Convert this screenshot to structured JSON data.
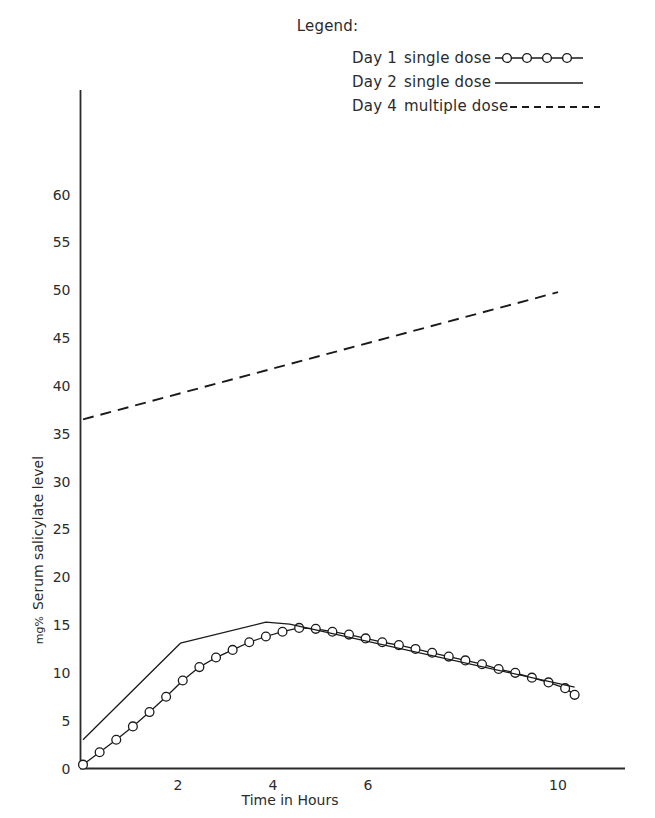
{
  "legend": {
    "heading": "Legend:",
    "entries": [
      {
        "day": "Day 1",
        "description": "single dose",
        "style": "line-with-circle-markers"
      },
      {
        "day": "Day 2",
        "description": "single dose",
        "style": "solid-line"
      },
      {
        "day": "Day 4",
        "description": "multiple dose",
        "style": "dashed-line"
      }
    ]
  },
  "chart_data": {
    "type": "line",
    "title": "",
    "xlabel": "Time in Hours",
    "ylabel": "mg% Serum salicylate level",
    "ylabel_prefix": "mg%",
    "ylabel_main": "Serum salicylate level",
    "xlim": [
      0,
      10.6
    ],
    "ylim": [
      0,
      62
    ],
    "xticks": [
      2,
      4,
      6,
      10
    ],
    "xtick_labels": [
      "2",
      "4",
      "6",
      "10"
    ],
    "yticks": [
      0,
      5,
      10,
      15,
      20,
      25,
      30,
      35,
      40,
      45,
      50,
      55,
      60
    ],
    "ytick_labels": [
      "0",
      "5",
      "10",
      "15",
      "20",
      "25",
      "30",
      "35",
      "40",
      "45",
      "50",
      "55",
      "60"
    ],
    "grid": false,
    "legend_position": "top-right",
    "axis_color": "#2b2b2b",
    "series": [
      {
        "name": "Day 1  single dose",
        "style": "solid-with-open-circle-markers",
        "color": "#1a1a1a",
        "marker": "open-circle",
        "x": [
          0.0,
          0.35,
          0.7,
          1.05,
          1.4,
          1.75,
          2.1,
          2.45,
          2.8,
          3.15,
          3.5,
          3.85,
          4.2,
          4.55,
          4.9,
          5.25,
          5.6,
          5.95,
          6.3,
          6.65,
          7.0,
          7.35,
          7.7,
          8.05,
          8.4,
          8.75,
          9.1,
          9.45,
          9.8,
          10.15,
          10.35
        ],
        "y": [
          0.4,
          1.7,
          3.0,
          4.4,
          5.9,
          7.5,
          9.2,
          10.6,
          11.6,
          12.4,
          13.2,
          13.8,
          14.3,
          14.7,
          14.6,
          14.3,
          14.0,
          13.6,
          13.2,
          12.9,
          12.5,
          12.1,
          11.7,
          11.3,
          10.9,
          10.4,
          10.0,
          9.5,
          9.0,
          8.4,
          7.7
        ]
      },
      {
        "name": "Day 2  single dose",
        "style": "solid",
        "color": "#1a1a1a",
        "marker": "none",
        "x": [
          0.0,
          2.05,
          3.85,
          4.35,
          10.35
        ],
        "y": [
          3.0,
          13.1,
          15.3,
          15.1,
          8.5
        ]
      },
      {
        "name": "Day 4  multiple dose",
        "style": "dashed",
        "color": "#1a1a1a",
        "marker": "none",
        "x": [
          0.0,
          10.0
        ],
        "y": [
          36.5,
          49.8
        ]
      }
    ]
  }
}
